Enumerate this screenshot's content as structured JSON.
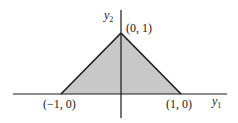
{
  "diagram": {
    "type": "region-plot",
    "shape": "triangle",
    "fill_color": "#c8c8c8",
    "stroke_color": "#1a1a1a",
    "vertices": [
      {
        "label": "(−1, 0)",
        "x": -1,
        "y": 0
      },
      {
        "label": "(0, 1)",
        "x": 0,
        "y": 1
      },
      {
        "label": "(1, 0)",
        "x": 1,
        "y": 0
      }
    ],
    "axes": {
      "horizontal": {
        "name": "y",
        "subscript": "1"
      },
      "vertical": {
        "name": "y",
        "subscript": "2"
      }
    }
  }
}
